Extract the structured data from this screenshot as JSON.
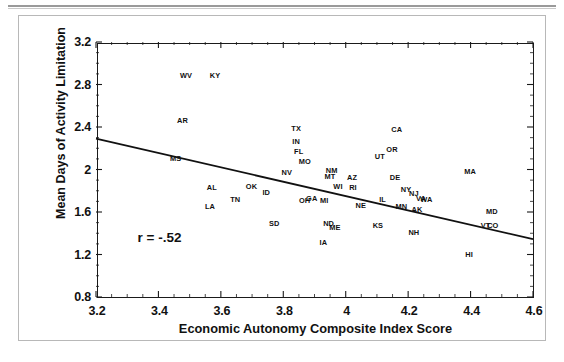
{
  "figure": {
    "kind": "scatter-plot-with-regression-line"
  },
  "chart_data": {
    "type": "scatter",
    "title": "",
    "xlabel": "Economic Autonomy Composite Index Score",
    "ylabel": "Mean Days of Activity Limitation",
    "xlim": [
      3.2,
      4.6
    ],
    "ylim": [
      0.8,
      3.2
    ],
    "xticks": [
      "3.2",
      "3.4",
      "3.6",
      "3.8",
      "4",
      "4.2",
      "4.4",
      "4.6"
    ],
    "xtick_values": [
      3.2,
      3.4,
      3.6,
      3.8,
      4.0,
      4.2,
      4.4,
      4.6
    ],
    "yticks": [
      "0.8",
      "1.2",
      "1.6",
      "2",
      "2.4",
      "2.8",
      "3.2"
    ],
    "ytick_values": [
      0.8,
      1.2,
      1.6,
      2.0,
      2.4,
      2.8,
      3.2
    ],
    "grid": false,
    "minor_ticks": true,
    "legend": null,
    "annotations": [
      {
        "text": "r = -.52",
        "x": 3.33,
        "y": 1.36
      }
    ],
    "trendline": {
      "type": "linear-fit",
      "x_start": 3.2,
      "y_start": 2.29,
      "x_end": 4.6,
      "y_end": 1.345
    },
    "point_label_field": "state",
    "points": [
      {
        "state": "WV",
        "x": 3.485,
        "y": 2.885
      },
      {
        "state": "KY",
        "x": 3.578,
        "y": 2.885
      },
      {
        "state": "AR",
        "x": 3.474,
        "y": 2.468
      },
      {
        "state": "MS",
        "x": 3.452,
        "y": 2.105
      },
      {
        "state": "TX",
        "x": 3.838,
        "y": 2.395
      },
      {
        "state": "IN",
        "x": 3.838,
        "y": 2.27
      },
      {
        "state": "FL",
        "x": 3.846,
        "y": 2.175
      },
      {
        "state": "MO",
        "x": 3.866,
        "y": 2.08
      },
      {
        "state": "NV",
        "x": 3.808,
        "y": 1.975
      },
      {
        "state": "NM",
        "x": 3.952,
        "y": 2.0
      },
      {
        "state": "MT",
        "x": 3.946,
        "y": 1.935
      },
      {
        "state": "CA",
        "x": 4.16,
        "y": 2.385
      },
      {
        "state": "OR",
        "x": 4.145,
        "y": 2.19
      },
      {
        "state": "UT",
        "x": 4.106,
        "y": 2.125
      },
      {
        "state": "MA",
        "x": 4.395,
        "y": 1.985
      },
      {
        "state": "DE",
        "x": 4.155,
        "y": 1.93
      },
      {
        "state": "AZ",
        "x": 4.017,
        "y": 1.925
      },
      {
        "state": "AL",
        "x": 3.568,
        "y": 1.84
      },
      {
        "state": "OK",
        "x": 3.695,
        "y": 1.845
      },
      {
        "state": "ID",
        "x": 3.742,
        "y": 1.79
      },
      {
        "state": "WI",
        "x": 3.972,
        "y": 1.845
      },
      {
        "state": "RI",
        "x": 4.02,
        "y": 1.835
      },
      {
        "state": "NY",
        "x": 4.19,
        "y": 1.815
      },
      {
        "state": "NJ",
        "x": 4.215,
        "y": 1.775
      },
      {
        "state": "TN",
        "x": 3.643,
        "y": 1.72
      },
      {
        "state": "LA",
        "x": 3.562,
        "y": 1.66
      },
      {
        "state": "OH",
        "x": 3.865,
        "y": 1.715
      },
      {
        "state": "GA",
        "x": 3.888,
        "y": 1.735
      },
      {
        "state": "MI",
        "x": 3.928,
        "y": 1.715
      },
      {
        "state": "IL",
        "x": 4.115,
        "y": 1.725
      },
      {
        "state": "VA",
        "x": 4.238,
        "y": 1.73
      },
      {
        "state": "WA",
        "x": 4.255,
        "y": 1.725
      },
      {
        "state": "NE",
        "x": 4.045,
        "y": 1.665
      },
      {
        "state": "MN",
        "x": 4.175,
        "y": 1.655
      },
      {
        "state": "AK",
        "x": 4.225,
        "y": 1.63
      },
      {
        "state": "SD",
        "x": 3.768,
        "y": 1.495
      },
      {
        "state": "ND",
        "x": 3.942,
        "y": 1.5
      },
      {
        "state": "ME",
        "x": 3.962,
        "y": 1.455
      },
      {
        "state": "KS",
        "x": 4.1,
        "y": 1.48
      },
      {
        "state": "NH",
        "x": 4.215,
        "y": 1.415
      },
      {
        "state": "MD",
        "x": 4.465,
        "y": 1.605
      },
      {
        "state": "VT",
        "x": 4.445,
        "y": 1.475
      },
      {
        "state": "CO",
        "x": 4.468,
        "y": 1.478
      },
      {
        "state": "IA",
        "x": 3.925,
        "y": 1.315
      },
      {
        "state": "HI",
        "x": 4.392,
        "y": 1.205
      }
    ]
  }
}
